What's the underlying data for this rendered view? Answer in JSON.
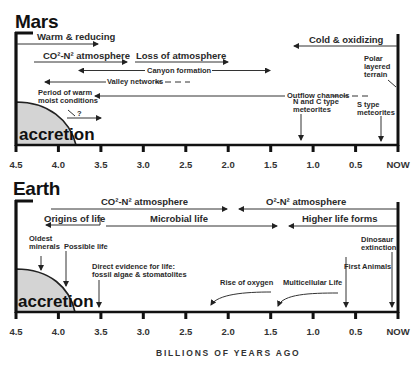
{
  "mars": {
    "title": "Mars",
    "accretion": "accretion",
    "labels": {
      "warm_reducing": "Warm & reducing",
      "co2_n2": "CO²-N² atmosphere",
      "loss_atmosphere": "Loss of atmosphere",
      "canyon": "Canyon formation",
      "valley": "Valley networks",
      "warm_moist_1": "Period of warm",
      "warm_moist_2": "moist conditions",
      "question": "?",
      "outflow": "Outflow channels",
      "cold_oxidizing": "Cold & oxidizing",
      "polar_1": "Polar",
      "polar_2": "layered",
      "polar_3": "terrain",
      "nc_1": "N and C type",
      "nc_2": "meteorites",
      "s_1": "S type",
      "s_2": "meteorites"
    }
  },
  "earth": {
    "title": "Earth",
    "accretion": "accretion",
    "labels": {
      "co2_n2": "CO²-N² atmosphere",
      "o2_n2": "O²-N² atmosphere",
      "origins": "Origins of life",
      "microbial": "Microbial life",
      "higher": "Higher life forms",
      "oldest_1": "Oldest",
      "oldest_2": "minerals",
      "possible": "Possible life",
      "direct_1": "Direct evidence for life:",
      "direct_2": "fossil algae & stomatolites",
      "rise_oxygen": "Rise of oxygen",
      "multicellular": "Multicellular Life",
      "first_animals": "First Animals",
      "dino_1": "Dinosaur",
      "dino_2": "extinction"
    }
  },
  "axis": {
    "ticks": [
      "4.5",
      "4.0",
      "3.5",
      "3.0",
      "2.5",
      "2.0",
      "1.5",
      "1.0",
      "0.5",
      "NOW"
    ],
    "xlabel": "BILLIONS OF YEARS AGO"
  },
  "colors": {
    "line": "#1a1a1a",
    "accretion_fill": "#d4d4d4"
  }
}
